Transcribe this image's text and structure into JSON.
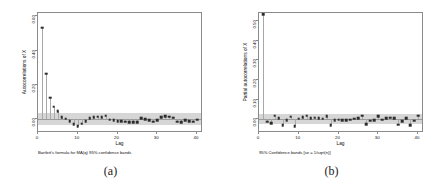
{
  "figure": {
    "panels": [
      {
        "key": "a",
        "subcaption": "(a)",
        "ylabel": "Autocorrelations of X",
        "xlabel": "Lag",
        "footnote": "Bartlett's formula for MA(q) 95% confidence bands",
        "yticks": [
          "0.00",
          "0.20",
          "0.40",
          "0.60"
        ]
      },
      {
        "key": "b",
        "subcaption": "(b)",
        "ylabel": "Partial autocorrelations of X",
        "xlabel": "Lag",
        "footnote": "95% Confidence bands [se = 1/sqrt(n)]",
        "yticks": [
          "0.00",
          "0.10",
          "0.20",
          "0.30",
          "0.40",
          "0.50"
        ]
      }
    ],
    "xticks": [
      "0",
      "10",
      "20",
      "30",
      "40"
    ],
    "colors": {
      "band": "#d6d6d6",
      "marker": "#2c2c2c",
      "stem": "#a8a8a8",
      "axis": "#8a8a8a"
    }
  },
  "chart_data": [
    {
      "type": "bar",
      "id": "acf",
      "title": "",
      "xlabel": "Lag",
      "ylabel": "Autocorrelations of X",
      "annotation": "Bartlett's formula for MA(q) 95% confidence bands",
      "xlim": [
        0,
        41
      ],
      "ylim": [
        -0.07,
        0.62
      ],
      "yticks": [
        0.0,
        0.2,
        0.4,
        0.6
      ],
      "xticks": [
        0,
        10,
        20,
        30,
        40
      ],
      "grid": false,
      "legend": null,
      "confidence_band": {
        "type": "bartlett",
        "level": 0.95,
        "upper": 0.035,
        "lower": -0.035
      },
      "x": [
        1,
        2,
        3,
        4,
        5,
        6,
        7,
        8,
        9,
        10,
        11,
        12,
        13,
        14,
        15,
        16,
        17,
        18,
        19,
        20,
        21,
        22,
        23,
        24,
        25,
        26,
        27,
        28,
        29,
        30,
        31,
        32,
        33,
        34,
        35,
        36,
        37,
        38,
        39,
        40
      ],
      "values": [
        0.535,
        0.265,
        0.125,
        0.073,
        0.047,
        0.01,
        0.003,
        -0.012,
        -0.03,
        -0.043,
        -0.028,
        -0.012,
        0.004,
        0.011,
        0.013,
        0.011,
        0.02,
        -0.003,
        -0.008,
        -0.011,
        -0.013,
        -0.016,
        -0.017,
        -0.019,
        -0.02,
        0.006,
        -0.002,
        -0.008,
        -0.015,
        -0.006,
        0.01,
        0.015,
        0.014,
        0.008,
        -0.015,
        -0.02,
        -0.008,
        -0.014,
        -0.016,
        -0.005
      ]
    },
    {
      "type": "bar",
      "id": "pacf",
      "title": "",
      "xlabel": "Lag",
      "ylabel": "Partial autocorrelations of X",
      "annotation": "95% Confidence bands [se = 1/sqrt(n)]",
      "xlim": [
        0,
        41
      ],
      "ylim": [
        -0.06,
        0.54
      ],
      "yticks": [
        0.0,
        0.1,
        0.2,
        0.3,
        0.4,
        0.5
      ],
      "xticks": [
        0,
        10,
        20,
        30,
        40
      ],
      "grid": false,
      "legend": null,
      "confidence_band": {
        "type": "se",
        "level": 0.95,
        "upper": 0.026,
        "lower": -0.026
      },
      "x": [
        1,
        2,
        3,
        4,
        5,
        6,
        7,
        8,
        9,
        10,
        11,
        12,
        13,
        14,
        15,
        16,
        17,
        18,
        19,
        20,
        21,
        22,
        23,
        24,
        25,
        26,
        27,
        28,
        29,
        30,
        31,
        32,
        33,
        34,
        35,
        36,
        37,
        38,
        39,
        40
      ],
      "values": [
        0.535,
        -0.012,
        -0.02,
        0.018,
        0.006,
        -0.03,
        -0.004,
        0.012,
        -0.036,
        0.002,
        0.01,
        0.018,
        0.005,
        0.007,
        0.004,
        0.002,
        0.014,
        -0.032,
        -0.006,
        -0.002,
        -0.004,
        -0.006,
        -0.003,
        0.002,
        0.006,
        0.018,
        -0.024,
        -0.008,
        -0.006,
        0.016,
        -0.002,
        0.004,
        0.008,
        0.006,
        -0.028,
        -0.01,
        0.004,
        -0.03,
        -0.008,
        0.018
      ]
    }
  ]
}
